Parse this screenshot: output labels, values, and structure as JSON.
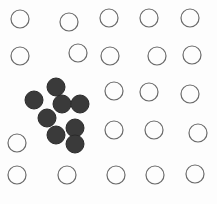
{
  "diagram": {
    "colors": {
      "background": "#fdfdfd",
      "open_stroke": "#6a6a6a",
      "filled": "#3a3a3a",
      "filled_stroke": "#2a2a2a"
    },
    "radius": 9,
    "open_circles": [
      {
        "cx": 20,
        "cy": 19
      },
      {
        "cx": 69,
        "cy": 22
      },
      {
        "cx": 109,
        "cy": 18
      },
      {
        "cx": 149,
        "cy": 18
      },
      {
        "cx": 190,
        "cy": 18
      },
      {
        "cx": 20,
        "cy": 56
      },
      {
        "cx": 78,
        "cy": 53
      },
      {
        "cx": 110,
        "cy": 56
      },
      {
        "cx": 157,
        "cy": 56
      },
      {
        "cx": 192,
        "cy": 55
      },
      {
        "cx": 114,
        "cy": 91
      },
      {
        "cx": 149,
        "cy": 92
      },
      {
        "cx": 190,
        "cy": 94
      },
      {
        "cx": 17,
        "cy": 143
      },
      {
        "cx": 114,
        "cy": 130
      },
      {
        "cx": 154,
        "cy": 130
      },
      {
        "cx": 198,
        "cy": 133
      },
      {
        "cx": 17,
        "cy": 175
      },
      {
        "cx": 67,
        "cy": 175
      },
      {
        "cx": 116,
        "cy": 175
      },
      {
        "cx": 155,
        "cy": 175
      },
      {
        "cx": 195,
        "cy": 174
      }
    ],
    "filled_circles": [
      {
        "cx": 56,
        "cy": 87
      },
      {
        "cx": 34,
        "cy": 100
      },
      {
        "cx": 62,
        "cy": 104
      },
      {
        "cx": 80,
        "cy": 104
      },
      {
        "cx": 47,
        "cy": 118
      },
      {
        "cx": 75,
        "cy": 128
      },
      {
        "cx": 56,
        "cy": 135
      },
      {
        "cx": 75,
        "cy": 144
      }
    ]
  }
}
